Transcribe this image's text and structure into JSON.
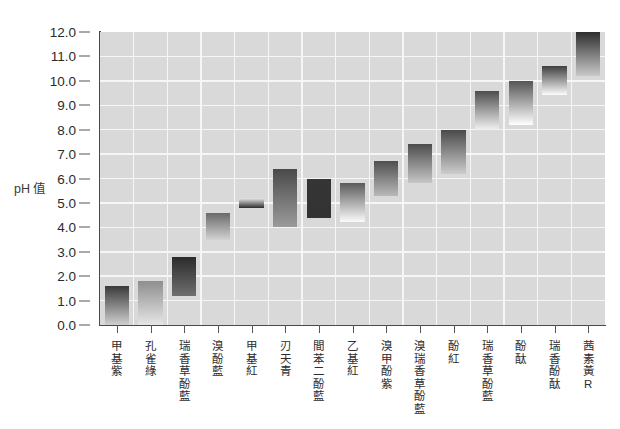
{
  "chart_data": {
    "type": "bar",
    "title": "",
    "subtitle": "",
    "xlabel": "",
    "ylabel": "pH 值",
    "ylim": [
      0.0,
      12.0
    ],
    "ytick_labels": [
      "0.0",
      "1.0",
      "2.0",
      "3.0",
      "4.0",
      "5.0",
      "6.0",
      "7.0",
      "8.0",
      "9.0",
      "10.0",
      "11.0",
      "12.0"
    ],
    "ytick_values": [
      0.0,
      1.0,
      2.0,
      3.0,
      4.0,
      5.0,
      6.0,
      7.0,
      8.0,
      9.0,
      10.0,
      11.0,
      12.0
    ],
    "grid": true,
    "legend": "none",
    "orientation": "vertical-range-bars",
    "note": "Each bar spans the pH transition range of an acid-base indicator; colour fades top(dark) to bottom(light).",
    "categories": [
      "甲基紫",
      "孔雀綠",
      "瑞香草酚藍",
      "溴酚藍",
      "甲基紅",
      "刃天青",
      "間苯二酚藍",
      "乙基紅",
      "溴甲酚紫",
      "溴瑞香草酚藍",
      "酚紅",
      "瑞香草酚藍",
      "酚酞",
      "瑞香酚酞",
      "茜素黃R"
    ],
    "bars": [
      {
        "label": "甲基紫",
        "low": 0.0,
        "high": 1.6,
        "top_color": "#3a3a3a",
        "bottom_color": "#cfcfcf"
      },
      {
        "label": "孔雀綠",
        "low": 0.0,
        "high": 1.8,
        "top_color": "#8e8e8e",
        "bottom_color": "#e6e6e6"
      },
      {
        "label": "瑞香草酚藍",
        "low": 1.2,
        "high": 2.8,
        "top_color": "#2b2b2b",
        "bottom_color": "#6f6f6f"
      },
      {
        "label": "溴酚藍",
        "low": 3.5,
        "high": 4.6,
        "top_color": "#6a6a6a",
        "bottom_color": "#d2d2d2"
      },
      {
        "label": "甲基紅",
        "low": 4.8,
        "high": 5.2,
        "top_color": "#e8e8e8",
        "bottom_color": "#2d2d2d"
      },
      {
        "label": "刃天青",
        "low": 4.0,
        "high": 6.4,
        "top_color": "#4a4a4a",
        "bottom_color": "#9b9b9b"
      },
      {
        "label": "間苯二酚藍",
        "low": 4.4,
        "high": 6.0,
        "top_color": "#353535",
        "bottom_color": "#333333"
      },
      {
        "label": "乙基紅",
        "low": 4.2,
        "high": 5.8,
        "top_color": "#5a5a5a",
        "bottom_color": "#fbfbfb"
      },
      {
        "label": "溴甲酚紫",
        "low": 5.3,
        "high": 6.7,
        "top_color": "#4f4f4f",
        "bottom_color": "#b9b9b9"
      },
      {
        "label": "溴瑞香草酚藍",
        "low": 5.8,
        "high": 7.4,
        "top_color": "#4c4c4c",
        "bottom_color": "#c6c6c6"
      },
      {
        "label": "酚紅",
        "low": 6.2,
        "high": 8.0,
        "top_color": "#4a4a4a",
        "bottom_color": "#cccccc"
      },
      {
        "label": "瑞香草酚藍",
        "low": 8.0,
        "high": 9.6,
        "top_color": "#4d4d4d",
        "bottom_color": "#f2f2f2"
      },
      {
        "label": "酚酞",
        "low": 8.2,
        "high": 10.0,
        "top_color": "#555555",
        "bottom_color": "#ffffff"
      },
      {
        "label": "瑞香酚酞",
        "low": 9.4,
        "high": 10.6,
        "top_color": "#3f3f3f",
        "bottom_color": "#fdfdfd"
      },
      {
        "label": "茜素黃R",
        "low": 10.2,
        "high": 12.0,
        "top_color": "#2e2e2e",
        "bottom_color": "#c9c9c9"
      }
    ]
  },
  "colors": {
    "plot_background": "#d9d9d9",
    "gridline": "#f6f6f6",
    "axis": "#4a4a4a",
    "text": "#2b2b2b",
    "page_background": "#ffffff"
  }
}
